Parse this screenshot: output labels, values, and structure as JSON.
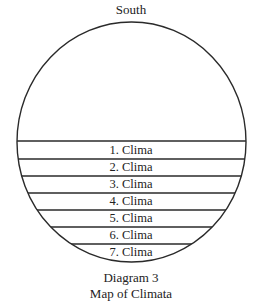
{
  "diagram": {
    "direction_label": "South",
    "bands": [
      {
        "label": "1. Clima"
      },
      {
        "label": "2. Clima"
      },
      {
        "label": "3. Clima"
      },
      {
        "label": "4. Clima"
      },
      {
        "label": "5. Clima"
      },
      {
        "label": "6. Clima"
      },
      {
        "label": "7. Clima"
      }
    ],
    "caption": {
      "line1": "Diagram 3",
      "line2": "Map of Climata"
    },
    "colors": {
      "stroke": "#2a2a2a",
      "text": "#222222",
      "background": "#ffffff"
    }
  }
}
